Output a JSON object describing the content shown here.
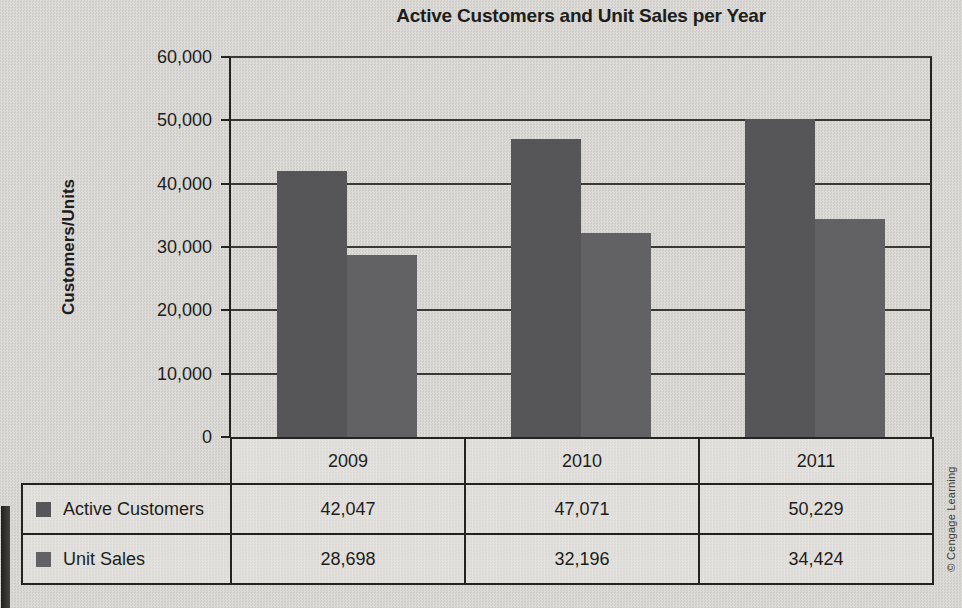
{
  "page": {
    "credit": "© Cengage Learning"
  },
  "chart_data": {
    "type": "bar",
    "title": "Active Customers and Unit Sales per Year",
    "xlabel": "",
    "ylabel": "Customers/Units",
    "categories": [
      "2009",
      "2010",
      "2011"
    ],
    "series": [
      {
        "name": "Active Customers",
        "color": "#565659",
        "values": [
          42047,
          47071,
          50229
        ],
        "values_formatted": [
          "42,047",
          "47,071",
          "50,229"
        ]
      },
      {
        "name": "Unit Sales",
        "color": "#626265",
        "values": [
          28698,
          32196,
          34424
        ],
        "values_formatted": [
          "28,698",
          "32,196",
          "34,424"
        ]
      }
    ],
    "ylim": [
      0,
      60000
    ],
    "ytick_step": 10000,
    "ytick_labels": [
      "0",
      "10,000",
      "20,000",
      "30,000",
      "40,000",
      "50,000",
      "60,000"
    ],
    "grid": true,
    "legend_position": "table-left"
  }
}
